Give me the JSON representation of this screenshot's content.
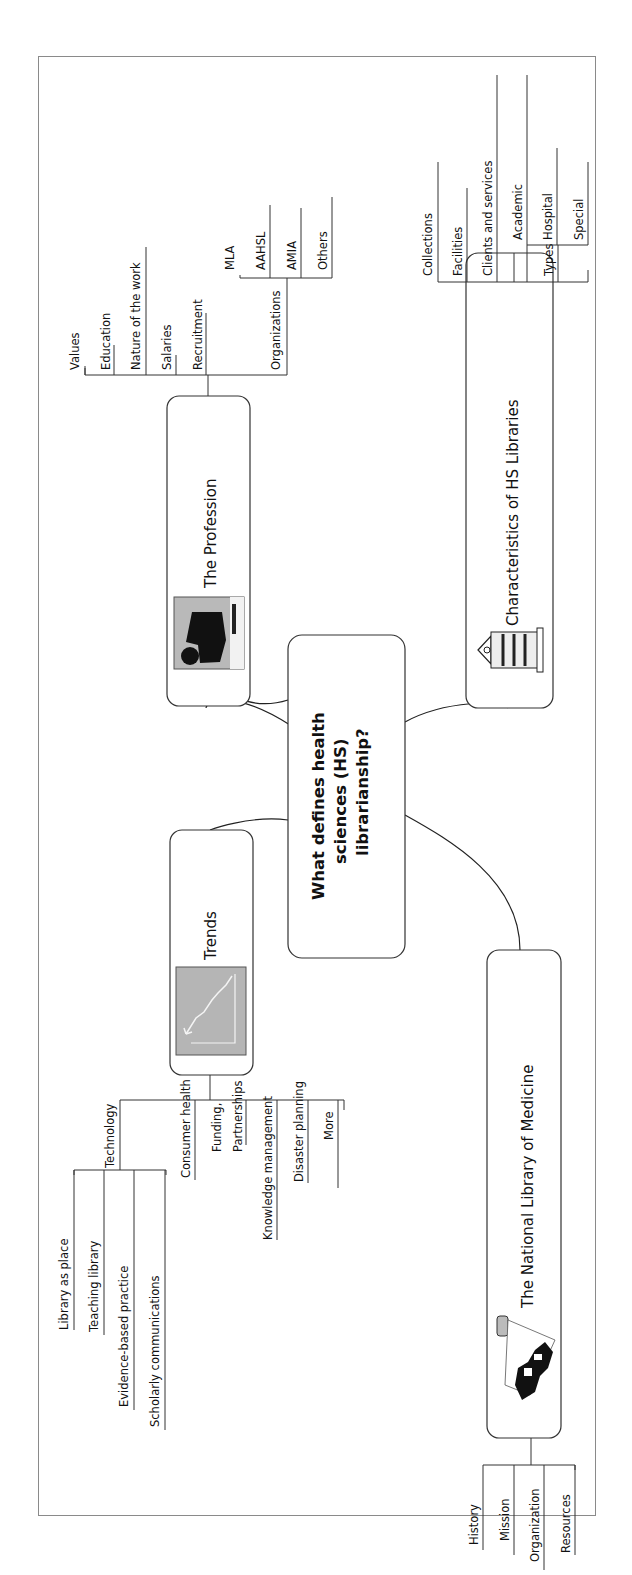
{
  "central": {
    "lines": [
      "What defines health",
      "sciences (HS)",
      "librarianship?"
    ]
  },
  "topics": {
    "profession": {
      "label": "The Profession",
      "icon": "person-at-computer-icon",
      "subtopics": [
        "Values",
        "Education",
        "Nature of the work",
        "Salaries",
        "Recruitment",
        "Organizations"
      ],
      "organizations": [
        "MLA",
        "AAHSL",
        "AMIA",
        "Others"
      ]
    },
    "characteristics": {
      "label": "Characteristics of HS Libraries",
      "icon": "library-building-icon",
      "subtopics": [
        "Collections",
        "Facilities",
        "Clients and services",
        "Types"
      ],
      "types": [
        "Academic",
        "Hospital",
        "Special"
      ]
    },
    "trends": {
      "label": "Trends",
      "icon": "trend-chart-icon",
      "subtopics": [
        "Technology",
        "Consumer health",
        "Funding,",
        "Partnerships",
        "Knowledge management",
        "Disaster planning",
        "More"
      ],
      "technology": [
        "Library as place",
        "Teaching library",
        "Evidence-based practice",
        "Scholarly communications"
      ]
    },
    "nlm": {
      "label": "The National Library of Medicine",
      "icon": "nlm-building-icon",
      "subtopics": [
        "History",
        "Mission",
        "Organization",
        "Resources"
      ]
    }
  }
}
